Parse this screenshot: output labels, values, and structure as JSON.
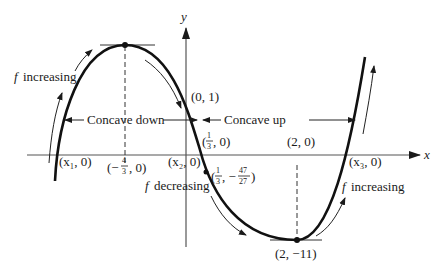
{
  "diagram": {
    "axes": {
      "x_label": "x",
      "y_label": "y"
    },
    "labels": {
      "y_intercept": "(0, 1)",
      "concave_down": "Concave down",
      "concave_up": "Concave up",
      "f_increasing_left": "increasing",
      "f_increasing_right": "increasing",
      "f_decreasing": "decreasing",
      "f_symbol": "f",
      "x1_root": "(x₁, 0)",
      "x2_root": "(x₂, 0)",
      "x3_root": "(x₃, 0)",
      "max_x_foot_open": "(−",
      "max_x_foot_num": "4",
      "max_x_foot_den": "3",
      "max_x_foot_close": ", 0)",
      "inflection_foot_open": "(",
      "inflection_foot_num": "1",
      "inflection_foot_den": "3",
      "inflection_foot_close": ", 0)",
      "inflection_pt_open": "(",
      "inflection_pt_num1": "1",
      "inflection_pt_den1": "3",
      "inflection_pt_mid": ", −",
      "inflection_pt_num2": "47",
      "inflection_pt_den2": "27",
      "inflection_pt_close": ")",
      "min_x_foot": "(2, 0)",
      "min_point": "(2, −11)"
    },
    "points": {
      "local_max": {
        "x": "-4/3",
        "y": ""
      },
      "local_min": {
        "x": 2,
        "y": -11
      },
      "inflection": {
        "x": "1/3",
        "y": "-47/27"
      },
      "y_intercept": {
        "x": 0,
        "y": 1
      }
    },
    "colors": {
      "ink": "#1a1a1a",
      "axis": "#555555"
    }
  }
}
